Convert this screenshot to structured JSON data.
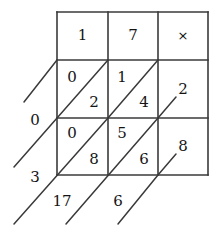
{
  "figure": {
    "kind": "lattice-multiplication-grid",
    "columns": 3,
    "rows": 3,
    "ink_color": "#3a3a3a",
    "text_color": "#141414",
    "background_color": "#ffffff"
  },
  "header_row": {
    "cells": [
      {
        "name": "multiplicand-digit-1",
        "value": "1"
      },
      {
        "name": "multiplicand-digit-2",
        "value": "7"
      },
      {
        "name": "operator",
        "value": "×"
      }
    ]
  },
  "lattice_rows": [
    {
      "multiplier_label": "0",
      "cells": [
        {
          "upper": "0",
          "lower": "2"
        },
        {
          "upper": "1",
          "lower": "4"
        },
        {
          "plain": "2"
        }
      ]
    },
    {
      "multiplier_label": "3",
      "cells": [
        {
          "upper": "0",
          "lower": "8"
        },
        {
          "upper": "5",
          "lower": "6"
        },
        {
          "plain": "8"
        }
      ]
    }
  ],
  "left_labels": [
    {
      "name": "multiplier-digit-1",
      "value": "0"
    },
    {
      "name": "multiplier-digit-2",
      "value": "3"
    }
  ],
  "bottom_labels": [
    {
      "name": "result-digit-1",
      "value": "17"
    },
    {
      "name": "result-digit-2",
      "value": "6"
    }
  ]
}
